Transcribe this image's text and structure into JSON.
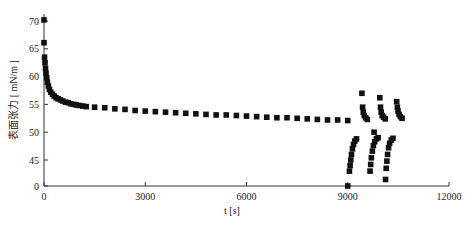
{
  "chart_data": {
    "type": "scatter",
    "title": "",
    "xlabel": "t [s]",
    "ylabel": "表面张力 [ mN/m ]",
    "xlim": [
      0,
      12000
    ],
    "ylim": [
      0,
      70
    ],
    "y_axis_break": {
      "from": 0,
      "to": 45
    },
    "grid": false,
    "legend": null,
    "x_ticks": [
      0,
      3000,
      6000,
      9000,
      12000
    ],
    "y_ticks": [
      0,
      45,
      50,
      55,
      60,
      65,
      70
    ],
    "marker": "square",
    "marker_color": "#111111",
    "series": [
      {
        "name": "surface tension",
        "points": [
          [
            0,
            70.2
          ],
          [
            0,
            66.1
          ],
          [
            15,
            63.5
          ],
          [
            30,
            62.5
          ],
          [
            45,
            61.5
          ],
          [
            60,
            60.6
          ],
          [
            80,
            59.8
          ],
          [
            100,
            59.0
          ],
          [
            130,
            58.3
          ],
          [
            160,
            57.7
          ],
          [
            200,
            57.2
          ],
          [
            250,
            56.8
          ],
          [
            300,
            56.5
          ],
          [
            360,
            56.2
          ],
          [
            420,
            56.0
          ],
          [
            490,
            55.8
          ],
          [
            560,
            55.6
          ],
          [
            640,
            55.4
          ],
          [
            720,
            55.3
          ],
          [
            800,
            55.1
          ],
          [
            880,
            55.0
          ],
          [
            960,
            54.9
          ],
          [
            1050,
            54.8
          ],
          [
            1150,
            54.7
          ],
          [
            1250,
            54.6
          ],
          [
            1500,
            54.5
          ],
          [
            1800,
            54.4
          ],
          [
            2100,
            54.2
          ],
          [
            2400,
            54.1
          ],
          [
            2700,
            53.9
          ],
          [
            3000,
            53.8
          ],
          [
            3300,
            53.7
          ],
          [
            3600,
            53.6
          ],
          [
            3900,
            53.5
          ],
          [
            4200,
            53.4
          ],
          [
            4500,
            53.3
          ],
          [
            4800,
            53.2
          ],
          [
            5100,
            53.1
          ],
          [
            5400,
            53.1
          ],
          [
            5700,
            53.0
          ],
          [
            6000,
            52.9
          ],
          [
            6300,
            52.8
          ],
          [
            6600,
            52.7
          ],
          [
            6900,
            52.6
          ],
          [
            7200,
            52.6
          ],
          [
            7500,
            52.5
          ],
          [
            7800,
            52.4
          ],
          [
            8100,
            52.3
          ],
          [
            8400,
            52.2
          ],
          [
            8700,
            52.2
          ],
          [
            9000,
            52.1
          ],
          [
            9000,
            0
          ],
          [
            9050,
            43.0
          ],
          [
            9070,
            44.0
          ],
          [
            9090,
            45.0
          ],
          [
            9110,
            46.0
          ],
          [
            9140,
            47.0
          ],
          [
            9170,
            47.8
          ],
          [
            9210,
            48.4
          ],
          [
            9260,
            48.8
          ],
          [
            9420,
            57.0
          ],
          [
            9440,
            54.5
          ],
          [
            9460,
            53.6
          ],
          [
            9490,
            53.0
          ],
          [
            9530,
            52.6
          ],
          [
            9580,
            52.3
          ],
          [
            9660,
            43.0
          ],
          [
            9680,
            44.2
          ],
          [
            9700,
            45.4
          ],
          [
            9730,
            46.6
          ],
          [
            9760,
            47.6
          ],
          [
            9800,
            48.3
          ],
          [
            9850,
            48.8
          ],
          [
            9900,
            49.0
          ],
          [
            9780,
            50.0
          ],
          [
            9950,
            56.2
          ],
          [
            9970,
            54.5
          ],
          [
            9990,
            53.6
          ],
          [
            10020,
            53.0
          ],
          [
            10060,
            52.7
          ],
          [
            10110,
            52.4
          ],
          [
            10120,
            41.5
          ],
          [
            10140,
            43.5
          ],
          [
            10160,
            44.8
          ],
          [
            10180,
            46.0
          ],
          [
            10210,
            47.2
          ],
          [
            10240,
            48.0
          ],
          [
            10290,
            48.6
          ],
          [
            10340,
            48.9
          ],
          [
            10450,
            55.5
          ],
          [
            10470,
            54.5
          ],
          [
            10490,
            53.8
          ],
          [
            10520,
            53.2
          ],
          [
            10560,
            52.8
          ],
          [
            10610,
            52.5
          ]
        ]
      }
    ]
  }
}
